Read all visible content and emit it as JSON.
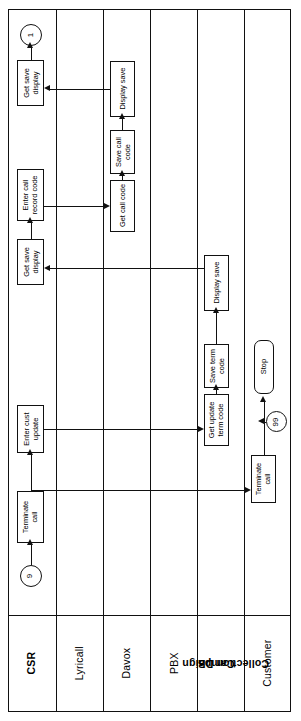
{
  "diagram": {
    "type": "swimlane-flowchart",
    "orientation": "rotated-90",
    "line_color": "#111111",
    "background_color": "#ffffff",
    "lanes": [
      {
        "id": "csr",
        "label": "CSR",
        "bold": true
      },
      {
        "id": "lyricall",
        "label": "Lyricall",
        "bold": false
      },
      {
        "id": "davox",
        "label": "Davox",
        "bold": false
      },
      {
        "id": "pbx",
        "label": "PBX",
        "bold": false
      },
      {
        "id": "campaign",
        "label": "Campaign\nCollection DB",
        "bold": true
      },
      {
        "id": "customer",
        "label": "Customer",
        "bold": false
      }
    ],
    "lane_titles": {
      "csr": "CSR",
      "lyricall": "Lyricall",
      "davox": "Davox",
      "pbx": "PBX",
      "campaign_line1": "Campaign",
      "campaign_line2": "Collection DB",
      "customer": "Customer"
    },
    "nodes": {
      "connector_out_1": "1",
      "csr_get_save_display_top_l1": "Get save",
      "csr_get_save_display_top_l2": "display",
      "csr_enter_call_record_l1": "Enter call",
      "csr_enter_call_record_l2": "record code",
      "csr_get_save_display_mid_l1": "Get save",
      "csr_get_save_display_mid_l2": "display",
      "csr_enter_cust_update_l1": "Enter cust",
      "csr_enter_cust_update_l2": "update",
      "csr_terminate_call_l1": "Terminate",
      "csr_terminate_call_l2": "call",
      "connector_in_9": "9",
      "davox_display_save": "Display save",
      "davox_save_call_code_l1": "Save call",
      "davox_save_call_code_l2": "code",
      "davox_get_call_code": "Get call code",
      "campaign_display_save": "Display save",
      "campaign_save_term_code_l1": "Save term",
      "campaign_save_term_code_l2": "code",
      "campaign_get_update_term_l1": "Get update",
      "campaign_get_update_term_l2": "term code",
      "customer_terminate_call_l1": "Terminate",
      "customer_terminate_call_l2": "call",
      "customer_stop": "Stop",
      "connector_in_99": "99"
    }
  }
}
